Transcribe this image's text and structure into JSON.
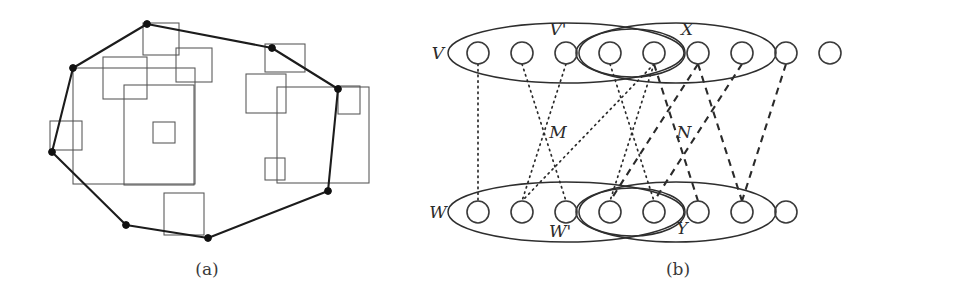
{
  "figure": {
    "panels": [
      {
        "id": "panel-a",
        "caption": "(a)",
        "title": "Convex hull of a set of rectangles",
        "hull_vertices": [
          [
            147,
            24
          ],
          [
            272,
            48
          ],
          [
            338,
            89
          ],
          [
            328,
            191
          ],
          [
            208,
            238
          ],
          [
            126,
            225
          ],
          [
            52,
            152
          ],
          [
            73,
            68
          ]
        ],
        "rectangles": [
          {
            "x": 143,
            "y": 23,
            "w": 36,
            "h": 32
          },
          {
            "x": 176,
            "y": 48,
            "w": 36,
            "h": 34
          },
          {
            "x": 103,
            "y": 57,
            "w": 44,
            "h": 42
          },
          {
            "x": 124,
            "y": 85,
            "w": 70,
            "h": 100
          },
          {
            "x": 50,
            "y": 121,
            "w": 32,
            "h": 29
          },
          {
            "x": 73,
            "y": 68,
            "w": 122,
            "h": 116
          },
          {
            "x": 153,
            "y": 122,
            "w": 22,
            "h": 21
          },
          {
            "x": 246,
            "y": 74,
            "w": 40,
            "h": 39
          },
          {
            "x": 265,
            "y": 44,
            "w": 40,
            "h": 28
          },
          {
            "x": 277,
            "y": 87,
            "w": 92,
            "h": 96
          },
          {
            "x": 338,
            "y": 86,
            "w": 22,
            "h": 28
          },
          {
            "x": 265,
            "y": 158,
            "w": 20,
            "h": 22
          },
          {
            "x": 164,
            "y": 193,
            "w": 40,
            "h": 42
          }
        ],
        "rect_note": "13 axis-parallel rectangles, convex hull drawn in bold with 8 marked vertices"
      },
      {
        "id": "panel-b",
        "caption": "(b)",
        "title": "Bipartite graph with matchings M and N",
        "row_labels": {
          "top": "V",
          "bottom": "W"
        },
        "group_labels": {
          "top_left": "V'",
          "top_right": "X",
          "bottom_left": "W'",
          "bottom_right": "Y"
        },
        "edge_labels": {
          "left": "M",
          "right": "N"
        },
        "top_nodes": 9,
        "bottom_nodes": 8,
        "node_start_x": 478,
        "node_spacing": 44,
        "node_radius": 11,
        "top_row_y": 53,
        "bottom_row_y": 212,
        "groups": [
          {
            "name": "V'",
            "row": "top",
            "from": 1,
            "to": 5,
            "rx": 118,
            "ry": 30
          },
          {
            "name": "inner-top",
            "row": "top",
            "from": 4,
            "to": 5,
            "rx": 53,
            "ry": 24
          },
          {
            "name": "X",
            "row": "top",
            "from": 4,
            "to": 7,
            "rx": 100,
            "ry": 30
          },
          {
            "name": "W'",
            "row": "bottom",
            "from": 1,
            "to": 5,
            "rx": 118,
            "ry": 30
          },
          {
            "name": "inner-bottom",
            "row": "bottom",
            "from": 4,
            "to": 5,
            "rx": 53,
            "ry": 24
          },
          {
            "name": "Y",
            "row": "bottom",
            "from": 4,
            "to": 7,
            "rx": 100,
            "ry": 30
          }
        ],
        "edges_m": [
          {
            "top": 1,
            "bottom": 1
          },
          {
            "top": 2,
            "bottom": 3
          },
          {
            "top": 3,
            "bottom": 2
          },
          {
            "top": 4,
            "bottom": 5
          },
          {
            "top": 5,
            "bottom": 4
          },
          {
            "top": 5,
            "bottom": 2
          }
        ],
        "edges_n": [
          {
            "top": 5,
            "bottom": 6
          },
          {
            "top": 6,
            "bottom": 4
          },
          {
            "top": 6,
            "bottom": 7
          },
          {
            "top": 7,
            "bottom": 5
          },
          {
            "top": 8,
            "bottom": 7
          }
        ],
        "colors": {
          "stroke": "#2a2a2a",
          "node": "#3a3a3a",
          "ellipse": "#2e2e2e"
        }
      }
    ]
  }
}
